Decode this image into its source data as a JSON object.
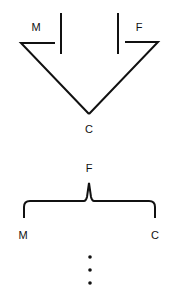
{
  "diagram": {
    "top": {
      "description": "Two vertical bars over a V shape converging to a point",
      "labels": {
        "left": "M",
        "right": "F",
        "bottom": "C"
      }
    },
    "bottom": {
      "description": "Curly brace opening downward",
      "labels": {
        "top": "F",
        "left": "M",
        "right": "C"
      },
      "continuation": "⋮"
    },
    "colors": {
      "stroke": "#111111",
      "background": "#ffffff"
    }
  }
}
